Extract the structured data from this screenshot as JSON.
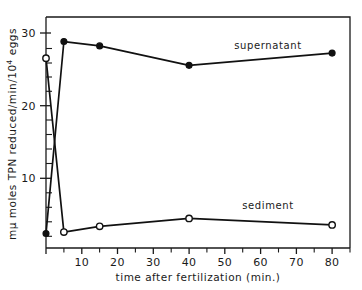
{
  "figure": {
    "background": "#ffffff",
    "ink_color": "#111111"
  },
  "axes": {
    "x": {
      "title": "time after fertilization (min.)",
      "min": 0,
      "max": 85,
      "major_ticks": [
        0,
        10,
        20,
        30,
        40,
        50,
        60,
        70,
        80
      ],
      "minor_ticks": [
        5,
        15,
        25,
        35,
        45,
        55,
        65,
        75,
        85
      ],
      "tick_labels": [
        "",
        "10",
        "20",
        "30",
        "40",
        "50",
        "60",
        "70",
        "80"
      ]
    },
    "y": {
      "title_parts": {
        "prefix": "mμ moles TPN reduced/min/10",
        "exponent": "4",
        "suffix": " eggs"
      },
      "title_plain": "mμ moles TPN reduced/min/10⁴ eggs",
      "min": 0,
      "max": 32,
      "major_ticks": [
        10,
        20,
        30
      ],
      "minor_ticks": [
        2,
        4,
        6,
        8,
        12,
        14,
        16,
        18,
        22,
        24,
        26,
        28
      ],
      "tick_labels": [
        "10",
        "20",
        "30"
      ]
    }
  },
  "chart_data": {
    "type": "line",
    "title": "",
    "xlabel": "time after fertilization (min.)",
    "ylabel": "mμ moles TPN reduced/min/10⁴ eggs",
    "xlim": [
      0,
      85
    ],
    "ylim": [
      0,
      32
    ],
    "grid": false,
    "legend_position": "inline-annotation",
    "series": [
      {
        "name": "supernatant",
        "marker": "filled-circle",
        "label_x": 62,
        "label_y": 28.2,
        "x": [
          0,
          5,
          15,
          40,
          80
        ],
        "y": [
          2.0,
          28.6,
          28.0,
          25.3,
          27.0
        ]
      },
      {
        "name": "sediment",
        "marker": "open-circle",
        "label_x": 62,
        "label_y": 6.6,
        "x": [
          0,
          5,
          15,
          40,
          80
        ],
        "y": [
          26.3,
          2.2,
          3.0,
          4.1,
          3.2
        ]
      }
    ]
  },
  "annotations": [
    {
      "id": "supernatant-label",
      "text": "supernatant"
    },
    {
      "id": "sediment-label",
      "text": "sediment"
    }
  ]
}
